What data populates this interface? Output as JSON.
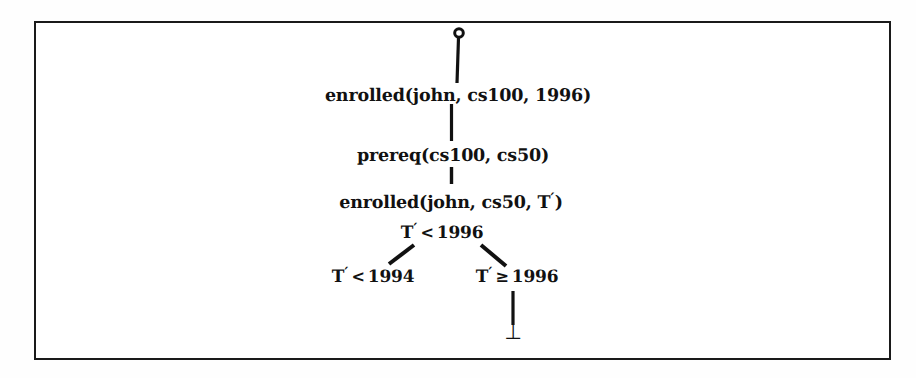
{
  "figure": {
    "type": "proof-tree",
    "frame": {
      "border_color": "#1a1a1a",
      "background": "#ffffff"
    },
    "root_node": {
      "shape": "open-circle",
      "label": ""
    },
    "nodes": [
      {
        "id": "goal-1",
        "text": "enrolled(john, cs100, 1996)",
        "kind": "goal"
      },
      {
        "id": "goal-2",
        "text": "prereq(cs100, cs50)",
        "kind": "goal"
      },
      {
        "id": "goal-3",
        "text": "enrolled(john, cs50, T′)",
        "kind": "goal"
      },
      {
        "id": "constraint-1",
        "text": "T′ < 1996",
        "kind": "constraint"
      },
      {
        "id": "constraint-left",
        "text": "T′ < 1994",
        "kind": "constraint"
      },
      {
        "id": "constraint-right",
        "text": "T′ ≥ 1996",
        "kind": "constraint"
      },
      {
        "id": "failure",
        "text": "⊥",
        "kind": "failure"
      }
    ],
    "labels": {
      "goal_1": "enrolled(john, cs100, 1996)",
      "goal_2": "prereq(cs100, cs50)",
      "goal_3_prefix": "enrolled(john, cs50, T",
      "goal_3_suffix": ")",
      "var_t": "T",
      "prime": "′",
      "lt": "<",
      "ge": "≥",
      "year_1996": "1996",
      "year_1994": "1994",
      "bottom": "⊥"
    },
    "text_color": "#111111"
  }
}
